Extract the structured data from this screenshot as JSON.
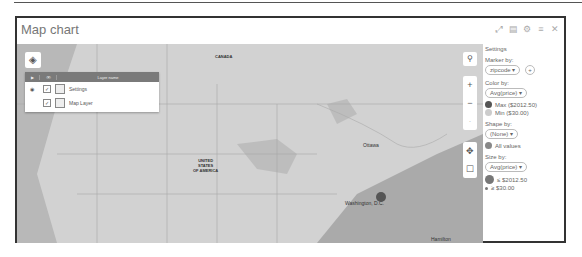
{
  "window": {
    "title": "Map chart",
    "controls": [
      "expand-icon",
      "copy-icon",
      "gear-icon",
      "list-icon",
      "close-icon"
    ],
    "control_glyphs": [
      "⤢",
      "▤",
      "⚙",
      "≡",
      "✕"
    ]
  },
  "map": {
    "layers_button_glyph": "◈",
    "layer_panel": {
      "headers": [
        "▶",
        "👁",
        "Layer name"
      ],
      "rows": [
        {
          "radio": "◉",
          "checked": "✓",
          "name": "Settings"
        },
        {
          "radio": "",
          "checked": "✓",
          "name": "Map Layer"
        }
      ]
    },
    "labels": {
      "canada": "CANADA",
      "usa": "UNITED\nSTATES\nOF AMERICA",
      "ottawa": "Ottawa",
      "washington": "Washington, D.C.",
      "hamilton": "Hamilton"
    },
    "controls": {
      "search": "⚲",
      "zoom_in": "+",
      "zoom_out": "−",
      "pan": "✥",
      "select": "☐"
    },
    "data_point_color": "#555555"
  },
  "settings": {
    "title": "Settings",
    "marker_by_label": "Marker by:",
    "marker_by_value": "zipcode",
    "color_by_label": "Color by:",
    "color_by_value": "Avg(price)",
    "color_max": "Max ($2012.50)",
    "color_min": "Min ($30.00)",
    "color_max_hex": "#555555",
    "color_min_hex": "#cccccc",
    "shape_by_label": "Shape by:",
    "shape_by_value": "(None)",
    "shape_all": "All values",
    "size_by_label": "Size by:",
    "size_by_value": "Avg(price)",
    "size_max": "≤ $2012.50",
    "size_min": "≥ $30.00",
    "dropdown_arrow": "▾",
    "add_glyph": "+"
  }
}
